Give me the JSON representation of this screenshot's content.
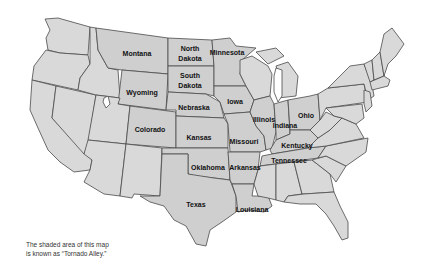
{
  "map": {
    "title": "United States map showing Tornado Alley",
    "colors": {
      "state_fill": "#d9d9d9",
      "alley_fill": "#cfcfcf",
      "border": "#4a4a4a",
      "label": "#111111",
      "background": "#ffffff"
    },
    "labels": {
      "montana": "Montana",
      "north_dakota_1": "North",
      "north_dakota_2": "Dakota",
      "minnesota": "Minnesota",
      "south_dakota_1": "South",
      "south_dakota_2": "Dakota",
      "wyoming": "Wyoming",
      "nebraska": "Nebraska",
      "iowa": "Iowa",
      "illinois": "Illinois",
      "indiana": "Indiana",
      "ohio": "Ohio",
      "colorado": "Colorado",
      "kansas": "Kansas",
      "missouri": "Missouri",
      "kentucky": "Kentucky",
      "tennessee": "Tennessee",
      "oklahoma": "Oklahoma",
      "arkansas": "Arkansas",
      "texas": "Texas",
      "louisiana": "Louisiana"
    },
    "shaded_states": [
      "North Dakota",
      "South Dakota",
      "Nebraska",
      "Kansas",
      "Oklahoma",
      "Texas",
      "Iowa",
      "Missouri",
      "Illinois",
      "Indiana",
      "Ohio",
      "Kentucky",
      "Tennessee",
      "Arkansas",
      "Louisiana",
      "Minnesota",
      "Wyoming",
      "Colorado",
      "Montana"
    ]
  },
  "caption": {
    "line1": "The shaded area of this map",
    "line2": "is known as “Tornado Alley.”"
  }
}
